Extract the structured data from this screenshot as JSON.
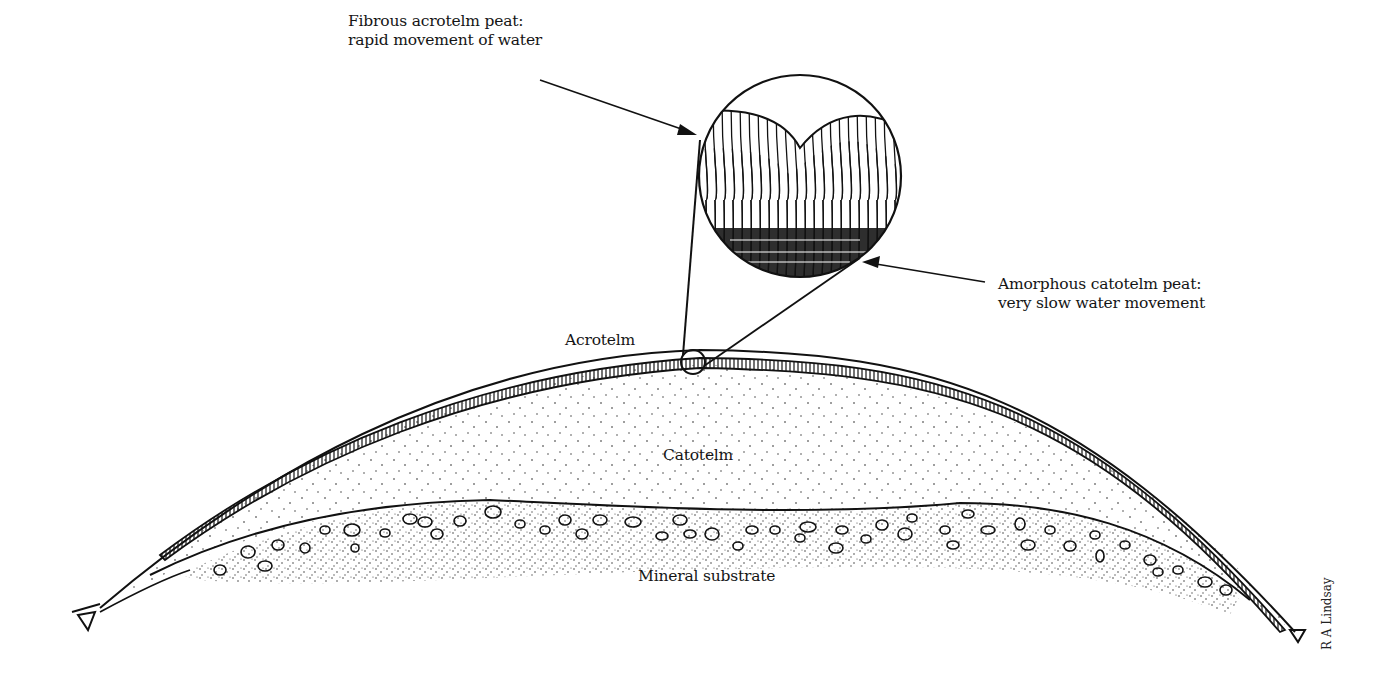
{
  "diagram": {
    "labels": {
      "acrotelm_callout_line1": "Fibrous acrotelm peat:",
      "acrotelm_callout_line2": "rapid movement of water",
      "catotelm_callout_line1": "Amorphous catotelm peat:",
      "catotelm_callout_line2": "very slow water movement",
      "acrotelm": "Acrotelm",
      "catotelm": "Catotelm",
      "mineral_substrate": "Mineral substrate",
      "credit": "R A Lindsay"
    },
    "layers": [
      {
        "name": "Acrotelm",
        "description": "Thin fibrous surface layer, hatched"
      },
      {
        "name": "Catotelm",
        "description": "Main body of peat, stippled"
      },
      {
        "name": "Mineral substrate",
        "description": "Base layer with stones, dense stipple"
      }
    ],
    "colors": {
      "ink": "#111111",
      "background": "#ffffff"
    }
  }
}
